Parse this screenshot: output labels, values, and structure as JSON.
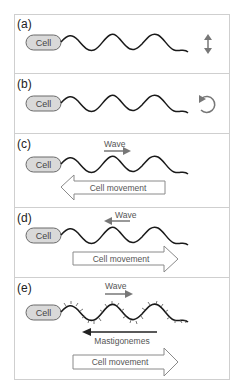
{
  "figure": {
    "colors": {
      "border": "#cfcfcf",
      "cell_fill": "#d9d9d9",
      "cell_stroke": "#6a6a6a",
      "flagellum": "#1a1a1a",
      "arrow_gray": "#777777",
      "mastigoneme_arrow": "#222222",
      "big_arrow_stroke": "#8a8a8a"
    },
    "panels": [
      {
        "id": "a",
        "label": "(a)",
        "cell_label": "Cell",
        "motion_icon": "up-down-arrow"
      },
      {
        "id": "b",
        "label": "(b)",
        "cell_label": "Cell",
        "motion_icon": "rotation-arrow"
      },
      {
        "id": "c",
        "label": "(c)",
        "cell_label": "Cell",
        "wave_label": "Wave",
        "wave_direction": "right",
        "movement_label": "Cell movement",
        "movement_direction": "left"
      },
      {
        "id": "d",
        "label": "(d)",
        "cell_label": "Cell",
        "wave_label": "Wave",
        "wave_direction": "left",
        "movement_label": "Cell movement",
        "movement_direction": "right"
      },
      {
        "id": "e",
        "label": "(e)",
        "cell_label": "Cell",
        "wave_label": "Wave",
        "wave_direction": "right",
        "mastigonemes_label": "Mastigonemes",
        "mastigonemes_direction": "left",
        "movement_label": "Cell movement",
        "movement_direction": "right"
      }
    ]
  }
}
